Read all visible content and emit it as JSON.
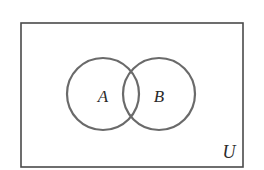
{
  "diagram": {
    "type": "venn",
    "universe": {
      "label": "U",
      "rect": {
        "x": 21,
        "y": 23,
        "width": 222,
        "height": 144
      },
      "stroke": "#4a4a4a"
    },
    "sets": [
      {
        "label": "A",
        "cx": 103,
        "cy": 94,
        "r": 36,
        "stroke": "#6a6a6a"
      },
      {
        "label": "B",
        "cx": 159,
        "cy": 94,
        "r": 36,
        "stroke": "#6a6a6a"
      }
    ],
    "labels": {
      "a": "A",
      "b": "B",
      "u": "U"
    }
  }
}
